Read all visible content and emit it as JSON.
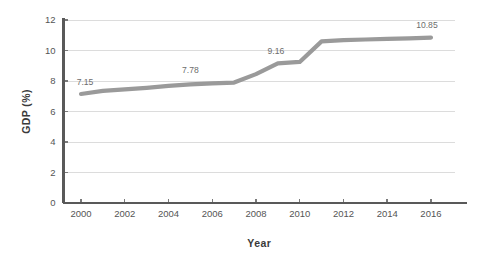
{
  "chart_data": {
    "type": "line",
    "title": "",
    "xlabel": "Year",
    "ylabel": "GDP (%)",
    "xlim": [
      1999.2,
      2017.1
    ],
    "ylim": [
      0,
      12
    ],
    "grid": true,
    "legend": "none",
    "line_color": "#9a9a9a",
    "grid_color": "#dcdcdc",
    "axis_color": "#595959",
    "x": [
      2000,
      2001,
      2002,
      2003,
      2004,
      2005,
      2006,
      2007,
      2008,
      2009,
      2010,
      2011,
      2012,
      2013,
      2014,
      2015,
      2016
    ],
    "values": [
      7.15,
      7.35,
      7.45,
      7.55,
      7.68,
      7.78,
      7.85,
      7.9,
      8.45,
      9.16,
      9.25,
      10.6,
      10.68,
      10.72,
      10.76,
      10.8,
      10.85
    ],
    "series": [
      {
        "name": "GDP",
        "values": [
          7.15,
          7.35,
          7.45,
          7.55,
          7.68,
          7.78,
          7.85,
          7.9,
          8.45,
          9.16,
          9.25,
          10.6,
          10.68,
          10.72,
          10.76,
          10.8,
          10.85
        ]
      }
    ],
    "yticks": [
      0,
      2,
      4,
      6,
      8,
      10,
      12
    ],
    "ytick_labels": [
      "0",
      "2",
      "4",
      "6",
      "8",
      "10",
      "12"
    ],
    "xticks": [
      2000,
      2002,
      2004,
      2006,
      2008,
      2010,
      2012,
      2014,
      2016
    ],
    "xtick_labels": [
      "2000",
      "2002",
      "2004",
      "2006",
      "2008",
      "2010",
      "2012",
      "2014",
      "2016"
    ],
    "annotations": [
      {
        "x": 2000,
        "y": 7.15,
        "text": "7.15",
        "dx": 4,
        "dy": -9
      },
      {
        "x": 2005,
        "y": 7.78,
        "text": "7.78",
        "dx": 0,
        "dy": -11
      },
      {
        "x": 2009,
        "y": 9.16,
        "text": "9.16",
        "dx": -2,
        "dy": -9
      },
      {
        "x": 2016,
        "y": 10.85,
        "text": "10.85",
        "dx": -4,
        "dy": -10
      }
    ]
  }
}
